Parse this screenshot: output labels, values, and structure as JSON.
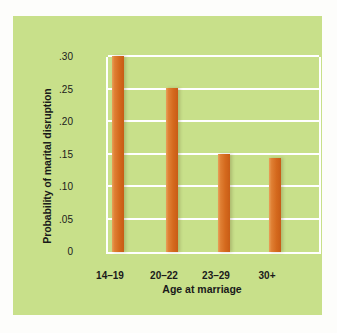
{
  "chart_data": {
    "type": "bar",
    "title": "",
    "categories": [
      "14–19",
      "20–22",
      "23–29",
      "30+"
    ],
    "values": [
      0.302,
      0.253,
      0.151,
      0.145
    ],
    "xlabel": "Age at marriage",
    "ylabel": "Probability of marital disruption",
    "ylim": [
      0,
      0.3
    ],
    "yticks": [
      "0",
      ".05",
      ".10",
      ".15",
      ".20",
      ".25",
      ".30"
    ],
    "ytick_values": [
      0,
      0.05,
      0.1,
      0.15,
      0.2,
      0.25,
      0.3
    ],
    "grid": true,
    "legend": "none",
    "colors": {
      "panel_background": "#c8e08a",
      "bar_fill": "#d4691d",
      "bar_highlight": "#e8a05a",
      "gridline": "#ffffff",
      "axis": "#ffffff",
      "text": "#1a1a1a",
      "figure_background": "#fdfdfb"
    }
  }
}
